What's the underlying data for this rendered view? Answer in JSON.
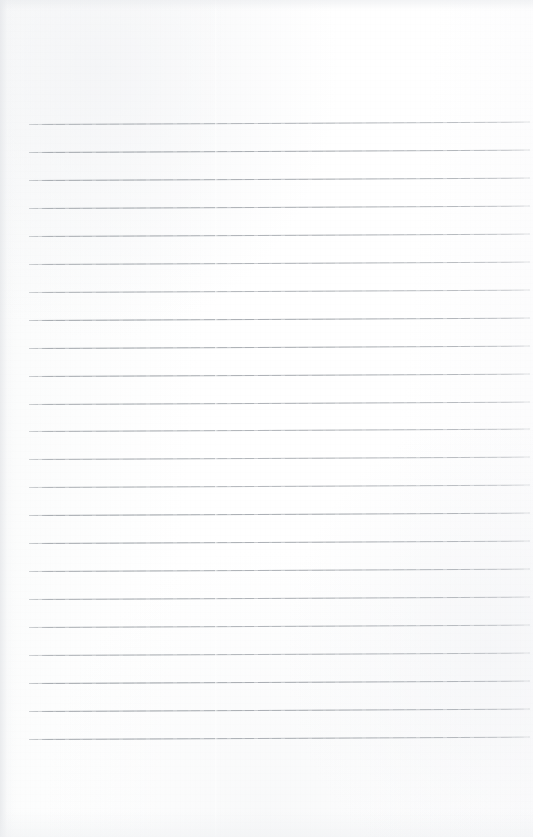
{
  "document": {
    "kind": "scanned-lined-paper",
    "title": "Blank ruled notebook page",
    "page_width": 533,
    "page_height": 837,
    "orientation": "portrait",
    "text_content": "",
    "has_handwriting": false,
    "has_printed_text": false
  },
  "colors": {
    "paper_background": "#fdfdfd",
    "paper_tint": "#fafbfb",
    "rule_line": "#8f959b",
    "rule_line_light": "#b6babf",
    "edge_shadow": "#e4e6e9"
  },
  "ruling": {
    "style": "wide-ruled horizontal lines",
    "line_count": 23,
    "first_line_y": 124,
    "line_spacing": 27.95,
    "line_thickness": 1,
    "line_left_x": 29,
    "line_right_x": 530,
    "line_length": 501,
    "slope_degrees": -0.28,
    "margin_top": 124,
    "margin_bottom": 97,
    "margin_left": 29,
    "margin_right": 3,
    "has_vertical_margin_rule": false,
    "has_holes": false,
    "lines_y": [
      124.0,
      151.9,
      179.9,
      207.8,
      235.8,
      263.7,
      291.7,
      319.6,
      347.6,
      375.5,
      403.5,
      431.4,
      459.4,
      487.3,
      515.3,
      543.2,
      571.2,
      599.1,
      627.1,
      655.0,
      683.0,
      710.9,
      738.9
    ]
  },
  "scan_artifacts": {
    "seam_x": 215,
    "left_edge_shadow_width": 16,
    "grain": "faint vertical scanner banding"
  }
}
